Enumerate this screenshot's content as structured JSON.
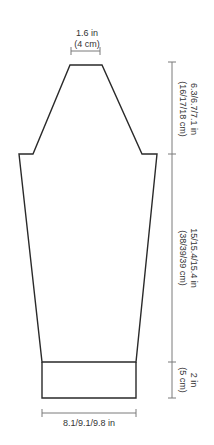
{
  "diagram": {
    "type": "knitting-schematic",
    "colors": {
      "outline": "#2a2a2a",
      "dimension_line": "#7a7a7a",
      "text": "#333333",
      "background": "#ffffff"
    },
    "measurements": {
      "top_width": {
        "imperial": "1.6 in",
        "metric": "(4 cm)"
      },
      "cap_height": {
        "imperial": "6.3/6.7/7.1 in",
        "metric": "(16/17/18 cm)"
      },
      "sleeve_length": {
        "imperial": "15/15.4/15.4 in",
        "metric": "(38/39/39 cm)"
      },
      "cuff_height": {
        "imperial": "2 in",
        "metric": "(5 cm)"
      },
      "cuff_width": {
        "imperial": "8.1/9.1/9.8 in"
      }
    }
  }
}
